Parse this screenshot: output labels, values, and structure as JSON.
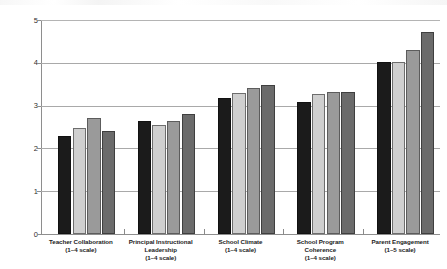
{
  "chart_data": {
    "type": "bar",
    "title": "",
    "subtitle": "",
    "xlabel": "",
    "ylabel": "",
    "ylim": [
      0,
      5
    ],
    "yticks": [
      0,
      1,
      2,
      3,
      4,
      5
    ],
    "ytick_labels": [
      "0",
      "1",
      "2",
      "3",
      "4",
      "5"
    ],
    "grid": true,
    "grid_axis": "y",
    "legend": false,
    "legend_position": "none",
    "orientation": "vertical",
    "categories": [
      "Teacher Collaboration (1–4 scale)",
      "Principal Instructional Leadership (1–4 scale)",
      "School Climate (1–4 scale)",
      "School Program Coherence (1–4 scale)",
      "Parent Engagement (1–5 scale)"
    ],
    "category_lines": [
      [
        "Teacher Collaboration",
        "(1–4 scale)"
      ],
      [
        "Principal Instructional",
        "Leadership",
        "(1–4 scale)"
      ],
      [
        "School Climate",
        "(1–4 scale)"
      ],
      [
        "School Program",
        "Coherence",
        "(1–4 scale)"
      ],
      [
        "Parent Engagement",
        "(1–5 scale)"
      ]
    ],
    "series": [
      {
        "name": "series-1",
        "color": "#1b1b1b",
        "values": [
          2.28,
          2.65,
          3.17,
          3.08,
          4.01
        ]
      },
      {
        "name": "series-2",
        "color": "#cfcfcf",
        "values": [
          2.48,
          2.55,
          3.29,
          3.28,
          4.03
        ]
      },
      {
        "name": "series-3",
        "color": "#9a9a9a",
        "values": [
          2.72,
          2.63,
          3.41,
          3.32,
          4.3
        ]
      },
      {
        "name": "series-4",
        "color": "#6b6b6b",
        "values": [
          2.4,
          2.81,
          3.49,
          3.32,
          4.73
        ]
      }
    ]
  },
  "colors": {
    "axis": "#8e8e8e",
    "gridline": "#a9a9a9",
    "text": "#1c1c1c",
    "background": "#ffffff"
  }
}
